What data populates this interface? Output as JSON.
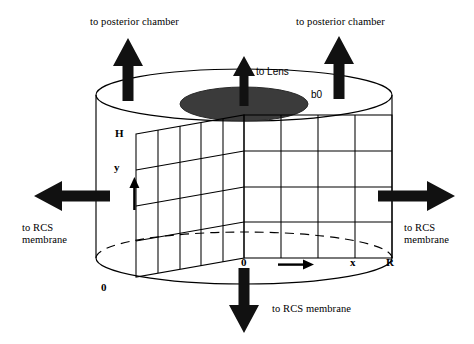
{
  "figure": {
    "type": "anatomical-schematic",
    "background_color": "#ffffff",
    "line_color": "#000000",
    "fill_color": "#3a3a3a"
  },
  "callouts": {
    "top_left": "to posterior chamber",
    "top_right": "to posterior chamber",
    "to_lens": "to Lens",
    "left": "to RCS\nmembrane",
    "right": "to RCS\nmembrane",
    "bottom": "to RCS membrane"
  },
  "annotations": {
    "b0": "b0",
    "height_top": "H",
    "y_axis": "y",
    "origin_left": "0",
    "origin_grid": "0",
    "x_axis": "x",
    "radius": "R"
  },
  "arrows": {
    "up_left": "arrow-up",
    "up_center": "arrow-up",
    "up_right": "arrow-up",
    "left": "arrow-left",
    "right": "arrow-right",
    "down": "arrow-down",
    "y_small": "arrow-up-small",
    "x_small": "arrow-right-small"
  },
  "geometry": {
    "cylinder_center_x": 244,
    "cylinder_rx": 148,
    "top_ellipse_cy": 95,
    "bottom_ellipse_cy": 258,
    "ellipse_ry": 26,
    "lens_ellipse": {
      "cx": 244,
      "cy": 104,
      "rx": 64,
      "ry": 17
    },
    "grid_left_columns": 5,
    "grid_left_rows": 4,
    "grid_right_columns": 4,
    "grid_right_rows": 4
  }
}
